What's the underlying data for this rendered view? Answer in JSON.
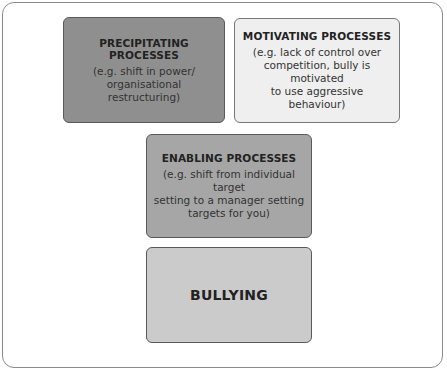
{
  "diagram": {
    "boxes": [
      {
        "id": "precipitating",
        "title": "PRECIPITATING PROCESSES",
        "description_lines": [
          "(e.g. shift in power/",
          "organisational restructuring)"
        ],
        "fill": "#8f8f8f"
      },
      {
        "id": "motivating",
        "title": "MOTIVATING PROCESSES",
        "description_lines": [
          "(e.g. lack of control over",
          "competition, bully is motivated",
          "to use aggressive behaviour)"
        ],
        "fill": "#efefef"
      },
      {
        "id": "enabling",
        "title": "ENABLING PROCESSES",
        "description_lines": [
          "(e.g. shift from individual target",
          "setting to a manager setting",
          "targets for you)"
        ],
        "fill": "#a6a6a6"
      },
      {
        "id": "bullying",
        "title": "BULLYING",
        "description_lines": [],
        "fill": "#cbcbcb"
      }
    ]
  }
}
